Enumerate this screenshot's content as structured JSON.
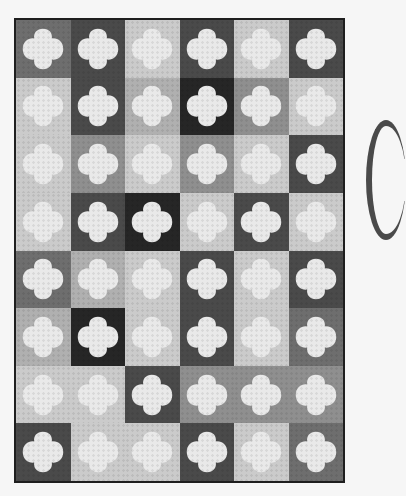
{
  "image": {
    "description": "Photograph of a grayscale pieced quilt with 6 columns × 8 rows of square blocks, each with a light quatrefoil (clamshell-lobed) applique on a background ranging from light gray to black",
    "grid": {
      "columns": 6,
      "rows": 8
    },
    "shape_color": "#e9e9e9",
    "binding_color": "#1e1e1e",
    "background_color": "#f6f6f6",
    "tones": {
      "black": "#262626",
      "dark": "#4a4a4a",
      "middark": "#6e6e6e",
      "mid": "#8f8f8f",
      "lightmid": "#b0b0b0",
      "light": "#cbcbcb"
    },
    "cells": [
      [
        "middark",
        "dark",
        "light",
        "dark",
        "light",
        "dark"
      ],
      [
        "light",
        "dark",
        "lightmid",
        "black",
        "mid",
        "light"
      ],
      [
        "light",
        "mid",
        "light",
        "mid",
        "light",
        "dark"
      ],
      [
        "light",
        "dark",
        "black",
        "light",
        "dark",
        "light"
      ],
      [
        "middark",
        "lightmid",
        "light",
        "dark",
        "light",
        "dark"
      ],
      [
        "lightmid",
        "black",
        "light",
        "dark",
        "light",
        "middark"
      ],
      [
        "light",
        "light",
        "dark",
        "mid",
        "mid",
        "mid"
      ],
      [
        "dark",
        "light",
        "light",
        "dark",
        "light",
        "middark"
      ]
    ]
  }
}
